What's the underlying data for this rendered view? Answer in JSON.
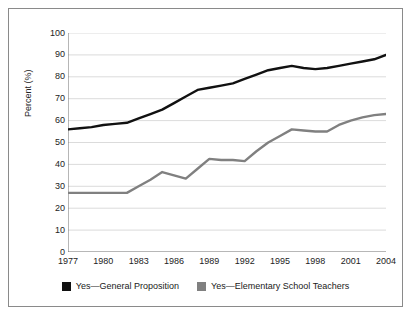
{
  "chart_data": {
    "type": "line",
    "title": "",
    "xlabel": "",
    "ylabel": "Percent (%)",
    "xlim": [
      1977,
      2004
    ],
    "ylim": [
      0,
      100
    ],
    "grid": true,
    "legend_position": "bottom",
    "y_ticks": [
      100,
      90,
      80,
      70,
      60,
      50,
      40,
      30,
      20,
      10,
      0
    ],
    "x_ticks": [
      1977,
      1980,
      1983,
      1986,
      1989,
      1992,
      1995,
      1998,
      2001,
      2004
    ],
    "x": [
      1977,
      1978,
      1979,
      1980,
      1981,
      1982,
      1983,
      1984,
      1985,
      1986,
      1987,
      1988,
      1989,
      1990,
      1991,
      1992,
      1993,
      1994,
      1995,
      1996,
      1997,
      1998,
      1999,
      2000,
      2001,
      2002,
      2003,
      2004
    ],
    "series": [
      {
        "name": "Yes—General Proposition",
        "color": "#111111",
        "values": [
          56,
          56.5,
          57,
          58,
          58.5,
          59,
          61,
          63,
          65,
          68,
          71,
          74,
          75,
          76,
          77,
          79,
          81,
          83,
          84,
          85,
          84,
          83.5,
          84,
          85,
          86,
          87,
          88,
          90
        ]
      },
      {
        "name": "Yes—Elementary School Teachers",
        "color": "#808080",
        "values": [
          27,
          27,
          27,
          27,
          27,
          27,
          30,
          33,
          36.5,
          35,
          33.5,
          38,
          42.5,
          42,
          42,
          41.5,
          46,
          50,
          53,
          56,
          55.5,
          55,
          55,
          58,
          60,
          61.5,
          62.5,
          63
        ]
      }
    ]
  },
  "legend": {
    "items": [
      {
        "label": "Yes—General Proposition",
        "color": "#111111",
        "name": "legend-general-proposition"
      },
      {
        "label": "Yes—Elementary School Teachers",
        "color": "#808080",
        "name": "legend-elementary-school-teachers"
      }
    ]
  },
  "style": {
    "grid_color": "#d2d2d2",
    "axis_color": "#6f6f6f",
    "border_color": "#8a8a8a",
    "background": "#ffffff",
    "text_color": "#232323"
  }
}
